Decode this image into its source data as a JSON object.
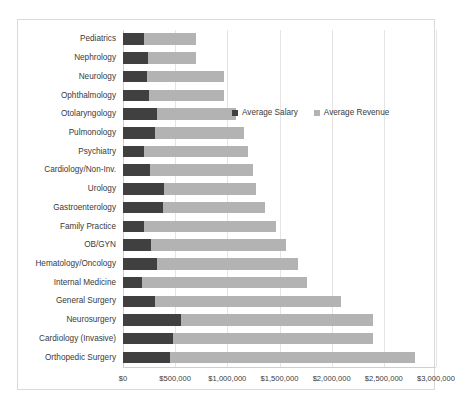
{
  "chart_data": {
    "type": "bar",
    "orientation": "horizontal",
    "stacked": true,
    "title": "",
    "xlabel": "",
    "ylabel": "",
    "xlim": [
      0,
      3000000
    ],
    "xticks": [
      0,
      500000,
      1000000,
      1500000,
      2000000,
      2500000,
      3000000
    ],
    "xtick_labels": [
      "$0",
      "$500,000",
      "$1,000,000",
      "$1,500,000",
      "$2,000,000",
      "$2,500,000",
      "$3,000,000"
    ],
    "grid": true,
    "legend_position": "inside-top-right",
    "categories": [
      "Pediatrics",
      "Nephrology",
      "Neurology",
      "Ophthalmology",
      "Otolaryngology",
      "Pulmonology",
      "Psychiatry",
      "Cardiology/Non-Inv.",
      "Urology",
      "Gastroenterology",
      "Family Practice",
      "OB/GYN",
      "Hematology/Oncology",
      "Internal Medicine",
      "General Surgery",
      "Neurosurgery",
      "Cardiology (Invasive)",
      "Orthopedic Surgery"
    ],
    "series": [
      {
        "name": "Average Salary",
        "color": "#404040",
        "values": [
          200000,
          240000,
          230000,
          250000,
          330000,
          310000,
          200000,
          260000,
          390000,
          380000,
          200000,
          270000,
          330000,
          180000,
          310000,
          560000,
          480000,
          450000
        ]
      },
      {
        "name": "Average Revenue",
        "color": "#b3b3b3",
        "values": [
          500000,
          460000,
          740000,
          720000,
          750000,
          850000,
          1000000,
          990000,
          880000,
          980000,
          1270000,
          1290000,
          1350000,
          1580000,
          1780000,
          1840000,
          1920000,
          2350000
        ]
      }
    ],
    "totals": [
      700000,
      700000,
      970000,
      970000,
      1080000,
      1160000,
      1200000,
      1250000,
      1270000,
      1360000,
      1470000,
      1560000,
      1680000,
      1760000,
      2090000,
      2400000,
      2400000,
      2800000
    ]
  },
  "legend": {
    "entries": [
      {
        "label": "Average Salary"
      },
      {
        "label": "Average Revenue"
      }
    ]
  },
  "colors": {
    "salary": "#404040",
    "revenue": "#b3b3b3",
    "gridline": "#e4e4e4",
    "frame": "#d9d9d9",
    "text": "#3a3a3a"
  }
}
